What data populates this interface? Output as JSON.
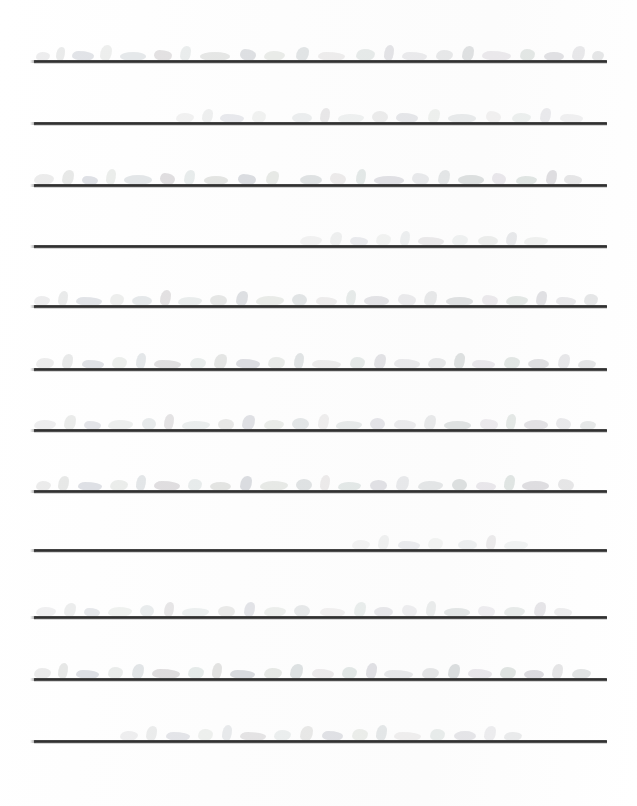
{
  "document": {
    "type": "scanned-ruled-paper",
    "description": "Scanned page of ruled notebook paper with very faint, washed-out handwriting",
    "page_width": 637,
    "page_height": 806,
    "background_color": "#fefefe",
    "legible_text": "",
    "transcription_note": "Handwriting is too faint and washed out in the scan to be legible"
  },
  "rules": {
    "count": 12,
    "color": "#2e2e2e",
    "thickness_px": 3,
    "left_x": 34,
    "right_x": 607,
    "y_positions": [
      60,
      122,
      184,
      245,
      305,
      368,
      429,
      490,
      549,
      616,
      678,
      740
    ]
  },
  "handwriting_rows": [
    {
      "baseline_y": 60,
      "ink_opacity": 0.2,
      "coverage": "full-width",
      "strokes": [
        {
          "x": 36,
          "w": 14,
          "h": 9
        },
        {
          "x": 56,
          "w": 9,
          "h": 14
        },
        {
          "x": 72,
          "w": 22,
          "h": 10
        },
        {
          "x": 100,
          "w": 12,
          "h": 16
        },
        {
          "x": 120,
          "w": 26,
          "h": 9
        },
        {
          "x": 154,
          "w": 18,
          "h": 11
        },
        {
          "x": 180,
          "w": 11,
          "h": 15
        },
        {
          "x": 200,
          "w": 30,
          "h": 9
        },
        {
          "x": 240,
          "w": 16,
          "h": 12
        },
        {
          "x": 264,
          "w": 21,
          "h": 10
        },
        {
          "x": 296,
          "w": 13,
          "h": 14
        },
        {
          "x": 318,
          "w": 27,
          "h": 9
        },
        {
          "x": 356,
          "w": 19,
          "h": 12
        },
        {
          "x": 384,
          "w": 10,
          "h": 16
        },
        {
          "x": 402,
          "w": 25,
          "h": 9
        },
        {
          "x": 436,
          "w": 17,
          "h": 11
        },
        {
          "x": 462,
          "w": 12,
          "h": 15
        },
        {
          "x": 482,
          "w": 29,
          "h": 10
        },
        {
          "x": 520,
          "w": 15,
          "h": 12
        },
        {
          "x": 544,
          "w": 20,
          "h": 9
        },
        {
          "x": 572,
          "w": 13,
          "h": 15
        },
        {
          "x": 592,
          "w": 12,
          "h": 10
        }
      ]
    },
    {
      "baseline_y": 122,
      "ink_opacity": 0.15,
      "coverage": "right-indented",
      "strokes": [
        {
          "x": 176,
          "w": 18,
          "h": 10
        },
        {
          "x": 202,
          "w": 11,
          "h": 14
        },
        {
          "x": 220,
          "w": 24,
          "h": 9
        },
        {
          "x": 252,
          "w": 14,
          "h": 12
        },
        {
          "x": 292,
          "w": 20,
          "h": 10
        },
        {
          "x": 320,
          "w": 10,
          "h": 15
        },
        {
          "x": 338,
          "w": 26,
          "h": 9
        },
        {
          "x": 372,
          "w": 16,
          "h": 12
        },
        {
          "x": 396,
          "w": 22,
          "h": 10
        },
        {
          "x": 428,
          "w": 12,
          "h": 14
        },
        {
          "x": 448,
          "w": 28,
          "h": 9
        },
        {
          "x": 486,
          "w": 15,
          "h": 12
        },
        {
          "x": 512,
          "w": 19,
          "h": 10
        },
        {
          "x": 540,
          "w": 11,
          "h": 15
        },
        {
          "x": 560,
          "w": 23,
          "h": 9
        }
      ]
    },
    {
      "baseline_y": 184,
      "ink_opacity": 0.22,
      "coverage": "full-width",
      "strokes": [
        {
          "x": 34,
          "w": 20,
          "h": 11
        },
        {
          "x": 62,
          "w": 12,
          "h": 15
        },
        {
          "x": 82,
          "w": 16,
          "h": 9
        },
        {
          "x": 106,
          "w": 10,
          "h": 16
        },
        {
          "x": 124,
          "w": 28,
          "h": 10
        },
        {
          "x": 160,
          "w": 15,
          "h": 12
        },
        {
          "x": 184,
          "w": 11,
          "h": 15
        },
        {
          "x": 204,
          "w": 24,
          "h": 9
        },
        {
          "x": 238,
          "w": 18,
          "h": 11
        },
        {
          "x": 266,
          "w": 13,
          "h": 14
        },
        {
          "x": 300,
          "w": 22,
          "h": 10
        },
        {
          "x": 330,
          "w": 16,
          "h": 12
        },
        {
          "x": 356,
          "w": 10,
          "h": 16
        },
        {
          "x": 374,
          "w": 30,
          "h": 9
        },
        {
          "x": 412,
          "w": 17,
          "h": 12
        },
        {
          "x": 438,
          "w": 12,
          "h": 15
        },
        {
          "x": 458,
          "w": 26,
          "h": 10
        },
        {
          "x": 492,
          "w": 14,
          "h": 12
        },
        {
          "x": 516,
          "w": 21,
          "h": 9
        },
        {
          "x": 546,
          "w": 11,
          "h": 15
        },
        {
          "x": 564,
          "w": 18,
          "h": 10
        }
      ]
    },
    {
      "baseline_y": 245,
      "ink_opacity": 0.14,
      "coverage": "center-right",
      "strokes": [
        {
          "x": 300,
          "w": 22,
          "h": 10
        },
        {
          "x": 330,
          "w": 12,
          "h": 14
        },
        {
          "x": 350,
          "w": 18,
          "h": 9
        },
        {
          "x": 376,
          "w": 15,
          "h": 12
        },
        {
          "x": 400,
          "w": 10,
          "h": 15
        },
        {
          "x": 418,
          "w": 26,
          "h": 9
        },
        {
          "x": 452,
          "w": 16,
          "h": 11
        },
        {
          "x": 478,
          "w": 20,
          "h": 10
        },
        {
          "x": 506,
          "w": 11,
          "h": 14
        },
        {
          "x": 524,
          "w": 24,
          "h": 9
        }
      ]
    },
    {
      "baseline_y": 305,
      "ink_opacity": 0.2,
      "coverage": "full-width",
      "strokes": [
        {
          "x": 34,
          "w": 16,
          "h": 10
        },
        {
          "x": 58,
          "w": 10,
          "h": 15
        },
        {
          "x": 76,
          "w": 26,
          "h": 9
        },
        {
          "x": 110,
          "w": 14,
          "h": 12
        },
        {
          "x": 132,
          "w": 20,
          "h": 10
        },
        {
          "x": 160,
          "w": 11,
          "h": 16
        },
        {
          "x": 178,
          "w": 24,
          "h": 9
        },
        {
          "x": 210,
          "w": 17,
          "h": 11
        },
        {
          "x": 236,
          "w": 12,
          "h": 15
        },
        {
          "x": 256,
          "w": 28,
          "h": 10
        },
        {
          "x": 292,
          "w": 15,
          "h": 12
        },
        {
          "x": 316,
          "w": 21,
          "h": 9
        },
        {
          "x": 346,
          "w": 10,
          "h": 16
        },
        {
          "x": 364,
          "w": 25,
          "h": 10
        },
        {
          "x": 398,
          "w": 18,
          "h": 12
        },
        {
          "x": 424,
          "w": 13,
          "h": 15
        },
        {
          "x": 446,
          "w": 27,
          "h": 9
        },
        {
          "x": 482,
          "w": 16,
          "h": 11
        },
        {
          "x": 506,
          "w": 22,
          "h": 10
        },
        {
          "x": 536,
          "w": 11,
          "h": 15
        },
        {
          "x": 556,
          "w": 20,
          "h": 9
        },
        {
          "x": 584,
          "w": 14,
          "h": 12
        }
      ]
    },
    {
      "baseline_y": 368,
      "ink_opacity": 0.21,
      "coverage": "full-width",
      "strokes": [
        {
          "x": 36,
          "w": 18,
          "h": 11
        },
        {
          "x": 62,
          "w": 11,
          "h": 15
        },
        {
          "x": 82,
          "w": 22,
          "h": 9
        },
        {
          "x": 112,
          "w": 15,
          "h": 12
        },
        {
          "x": 136,
          "w": 10,
          "h": 16
        },
        {
          "x": 154,
          "w": 27,
          "h": 9
        },
        {
          "x": 190,
          "w": 16,
          "h": 11
        },
        {
          "x": 214,
          "w": 13,
          "h": 15
        },
        {
          "x": 236,
          "w": 24,
          "h": 10
        },
        {
          "x": 268,
          "w": 17,
          "h": 12
        },
        {
          "x": 294,
          "w": 10,
          "h": 16
        },
        {
          "x": 312,
          "w": 29,
          "h": 9
        },
        {
          "x": 350,
          "w": 15,
          "h": 12
        },
        {
          "x": 374,
          "w": 12,
          "h": 15
        },
        {
          "x": 394,
          "w": 26,
          "h": 10
        },
        {
          "x": 428,
          "w": 18,
          "h": 11
        },
        {
          "x": 454,
          "w": 11,
          "h": 16
        },
        {
          "x": 472,
          "w": 23,
          "h": 9
        },
        {
          "x": 504,
          "w": 16,
          "h": 12
        },
        {
          "x": 528,
          "w": 21,
          "h": 10
        },
        {
          "x": 558,
          "w": 12,
          "h": 15
        },
        {
          "x": 578,
          "w": 18,
          "h": 9
        }
      ]
    },
    {
      "baseline_y": 429,
      "ink_opacity": 0.19,
      "coverage": "full-width",
      "strokes": [
        {
          "x": 34,
          "w": 22,
          "h": 10
        },
        {
          "x": 64,
          "w": 12,
          "h": 15
        },
        {
          "x": 84,
          "w": 17,
          "h": 9
        },
        {
          "x": 108,
          "w": 25,
          "h": 10
        },
        {
          "x": 142,
          "w": 14,
          "h": 12
        },
        {
          "x": 164,
          "w": 10,
          "h": 16
        },
        {
          "x": 182,
          "w": 28,
          "h": 9
        },
        {
          "x": 218,
          "w": 16,
          "h": 11
        },
        {
          "x": 242,
          "w": 13,
          "h": 15
        },
        {
          "x": 264,
          "w": 20,
          "h": 10
        },
        {
          "x": 292,
          "w": 17,
          "h": 12
        },
        {
          "x": 318,
          "w": 11,
          "h": 16
        },
        {
          "x": 336,
          "w": 26,
          "h": 9
        },
        {
          "x": 370,
          "w": 15,
          "h": 12
        },
        {
          "x": 394,
          "w": 22,
          "h": 10
        },
        {
          "x": 424,
          "w": 12,
          "h": 15
        },
        {
          "x": 444,
          "w": 27,
          "h": 9
        },
        {
          "x": 480,
          "w": 18,
          "h": 11
        },
        {
          "x": 506,
          "w": 10,
          "h": 16
        },
        {
          "x": 524,
          "w": 24,
          "h": 10
        },
        {
          "x": 556,
          "w": 15,
          "h": 12
        },
        {
          "x": 580,
          "w": 16,
          "h": 9
        }
      ]
    },
    {
      "baseline_y": 490,
      "ink_opacity": 0.22,
      "coverage": "full-width",
      "strokes": [
        {
          "x": 36,
          "w": 15,
          "h": 10
        },
        {
          "x": 58,
          "w": 11,
          "h": 15
        },
        {
          "x": 78,
          "w": 24,
          "h": 9
        },
        {
          "x": 110,
          "w": 18,
          "h": 11
        },
        {
          "x": 136,
          "w": 10,
          "h": 16
        },
        {
          "x": 154,
          "w": 26,
          "h": 10
        },
        {
          "x": 188,
          "w": 14,
          "h": 12
        },
        {
          "x": 210,
          "w": 21,
          "h": 9
        },
        {
          "x": 240,
          "w": 12,
          "h": 15
        },
        {
          "x": 260,
          "w": 28,
          "h": 10
        },
        {
          "x": 296,
          "w": 16,
          "h": 12
        },
        {
          "x": 320,
          "w": 10,
          "h": 16
        },
        {
          "x": 338,
          "w": 23,
          "h": 9
        },
        {
          "x": 370,
          "w": 17,
          "h": 11
        },
        {
          "x": 396,
          "w": 13,
          "h": 15
        },
        {
          "x": 418,
          "w": 25,
          "h": 10
        },
        {
          "x": 452,
          "w": 15,
          "h": 12
        },
        {
          "x": 476,
          "w": 20,
          "h": 9
        },
        {
          "x": 504,
          "w": 11,
          "h": 16
        },
        {
          "x": 522,
          "w": 27,
          "h": 10
        },
        {
          "x": 558,
          "w": 16,
          "h": 12
        }
      ]
    },
    {
      "baseline_y": 549,
      "ink_opacity": 0.13,
      "coverage": "right-only",
      "strokes": [
        {
          "x": 352,
          "w": 18,
          "h": 10
        },
        {
          "x": 378,
          "w": 11,
          "h": 15
        },
        {
          "x": 398,
          "w": 22,
          "h": 9
        },
        {
          "x": 428,
          "w": 15,
          "h": 12
        },
        {
          "x": 458,
          "w": 19,
          "h": 10
        },
        {
          "x": 486,
          "w": 10,
          "h": 15
        },
        {
          "x": 504,
          "w": 24,
          "h": 9
        }
      ]
    },
    {
      "baseline_y": 616,
      "ink_opacity": 0.17,
      "coverage": "full-width",
      "strokes": [
        {
          "x": 36,
          "w": 20,
          "h": 10
        },
        {
          "x": 64,
          "w": 12,
          "h": 14
        },
        {
          "x": 84,
          "w": 16,
          "h": 9
        },
        {
          "x": 108,
          "w": 24,
          "h": 10
        },
        {
          "x": 140,
          "w": 14,
          "h": 12
        },
        {
          "x": 164,
          "w": 10,
          "h": 15
        },
        {
          "x": 182,
          "w": 27,
          "h": 9
        },
        {
          "x": 218,
          "w": 17,
          "h": 11
        },
        {
          "x": 244,
          "w": 11,
          "h": 15
        },
        {
          "x": 264,
          "w": 22,
          "h": 10
        },
        {
          "x": 294,
          "w": 16,
          "h": 12
        },
        {
          "x": 320,
          "w": 25,
          "h": 9
        },
        {
          "x": 354,
          "w": 12,
          "h": 15
        },
        {
          "x": 374,
          "w": 19,
          "h": 10
        },
        {
          "x": 402,
          "w": 15,
          "h": 12
        },
        {
          "x": 426,
          "w": 10,
          "h": 16
        },
        {
          "x": 444,
          "w": 26,
          "h": 9
        },
        {
          "x": 478,
          "w": 17,
          "h": 11
        },
        {
          "x": 504,
          "w": 21,
          "h": 10
        },
        {
          "x": 534,
          "w": 12,
          "h": 15
        },
        {
          "x": 554,
          "w": 18,
          "h": 9
        }
      ]
    },
    {
      "baseline_y": 678,
      "ink_opacity": 0.23,
      "coverage": "full-width",
      "strokes": [
        {
          "x": 34,
          "w": 17,
          "h": 11
        },
        {
          "x": 58,
          "w": 10,
          "h": 16
        },
        {
          "x": 76,
          "w": 23,
          "h": 9
        },
        {
          "x": 108,
          "w": 15,
          "h": 12
        },
        {
          "x": 132,
          "w": 12,
          "h": 15
        },
        {
          "x": 152,
          "w": 28,
          "h": 10
        },
        {
          "x": 188,
          "w": 16,
          "h": 12
        },
        {
          "x": 212,
          "w": 10,
          "h": 16
        },
        {
          "x": 230,
          "w": 25,
          "h": 9
        },
        {
          "x": 264,
          "w": 18,
          "h": 11
        },
        {
          "x": 290,
          "w": 13,
          "h": 15
        },
        {
          "x": 312,
          "w": 22,
          "h": 10
        },
        {
          "x": 342,
          "w": 15,
          "h": 12
        },
        {
          "x": 366,
          "w": 11,
          "h": 16
        },
        {
          "x": 384,
          "w": 29,
          "h": 9
        },
        {
          "x": 422,
          "w": 17,
          "h": 11
        },
        {
          "x": 448,
          "w": 12,
          "h": 15
        },
        {
          "x": 468,
          "w": 24,
          "h": 10
        },
        {
          "x": 500,
          "w": 16,
          "h": 12
        },
        {
          "x": 524,
          "w": 20,
          "h": 9
        },
        {
          "x": 552,
          "w": 11,
          "h": 15
        },
        {
          "x": 572,
          "w": 19,
          "h": 10
        }
      ]
    },
    {
      "baseline_y": 740,
      "ink_opacity": 0.18,
      "coverage": "center-right",
      "strokes": [
        {
          "x": 120,
          "w": 18,
          "h": 10
        },
        {
          "x": 146,
          "w": 11,
          "h": 15
        },
        {
          "x": 166,
          "w": 24,
          "h": 9
        },
        {
          "x": 198,
          "w": 15,
          "h": 12
        },
        {
          "x": 222,
          "w": 10,
          "h": 16
        },
        {
          "x": 240,
          "w": 26,
          "h": 9
        },
        {
          "x": 274,
          "w": 17,
          "h": 11
        },
        {
          "x": 300,
          "w": 13,
          "h": 15
        },
        {
          "x": 322,
          "w": 21,
          "h": 10
        },
        {
          "x": 352,
          "w": 16,
          "h": 12
        },
        {
          "x": 376,
          "w": 11,
          "h": 16
        },
        {
          "x": 394,
          "w": 27,
          "h": 9
        },
        {
          "x": 430,
          "w": 15,
          "h": 12
        },
        {
          "x": 454,
          "w": 22,
          "h": 10
        },
        {
          "x": 484,
          "w": 12,
          "h": 15
        },
        {
          "x": 504,
          "w": 18,
          "h": 9
        }
      ]
    }
  ]
}
